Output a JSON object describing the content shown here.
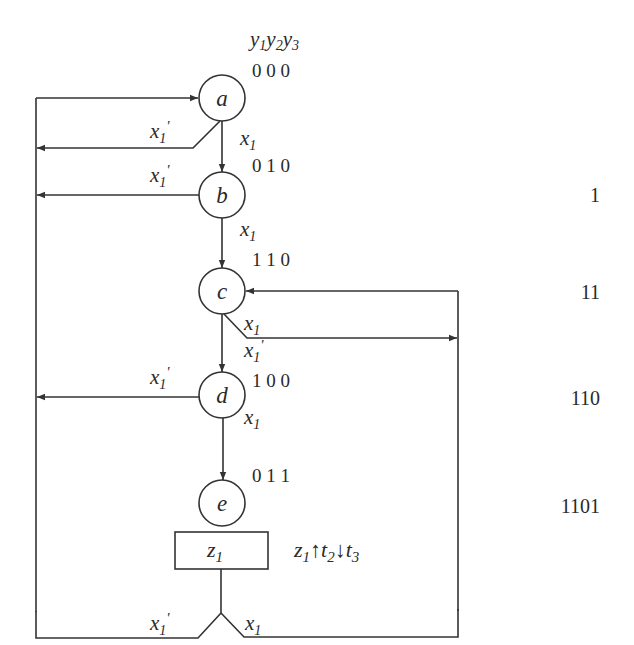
{
  "diagram": {
    "type": "ASM / state flowchart",
    "state_code_header": {
      "y1": "y",
      "y1_sub": "1",
      "y2": "y",
      "y2_sub": "2",
      "y3": "y",
      "y3_sub": "3"
    },
    "nodes": [
      {
        "id": "a",
        "label": "a",
        "code": "0 0 0"
      },
      {
        "id": "b",
        "label": "b",
        "code": "0 1 0"
      },
      {
        "id": "c",
        "label": "c",
        "code": "1 1 0"
      },
      {
        "id": "d",
        "label": "d",
        "code": "1 0 0"
      },
      {
        "id": "e",
        "label": "e",
        "code": "0 1 1"
      }
    ],
    "output_box": {
      "label": "z",
      "sub": "1"
    },
    "output_action": {
      "z": "z",
      "z_sub": "1",
      "up": "↑",
      "t2": "t",
      "t2_sub": "2",
      "down": "↓",
      "t3": "t",
      "t3_sub": "3"
    },
    "edge_labels": {
      "x": "x",
      "sub": "1",
      "prime": "'"
    },
    "sequence_labels": [
      "1",
      "11",
      "110",
      "1101"
    ],
    "edges": [
      {
        "from": "a",
        "to": "b",
        "condition": "x1"
      },
      {
        "from": "a",
        "to": "a",
        "condition": "x1'"
      },
      {
        "from": "b",
        "to": "c",
        "condition": "x1"
      },
      {
        "from": "b",
        "to": "a",
        "condition": "x1'"
      },
      {
        "from": "c",
        "to": "c",
        "condition": "x1"
      },
      {
        "from": "c",
        "to": "d",
        "condition": "x1'"
      },
      {
        "from": "d",
        "to": "e",
        "condition": "x1"
      },
      {
        "from": "d",
        "to": "a",
        "condition": "x1'"
      },
      {
        "from": "e",
        "to": "a",
        "condition": "x1'"
      },
      {
        "from": "e",
        "to": "c",
        "condition": "x1"
      }
    ]
  }
}
